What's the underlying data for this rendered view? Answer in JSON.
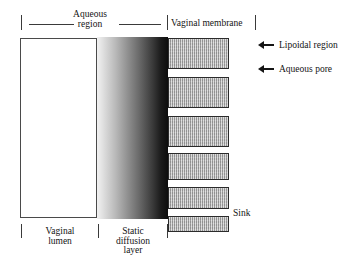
{
  "figure": {
    "type": "schematic-diagram"
  },
  "top_labels": {
    "aqueous_region": "Aqueous\nregion",
    "aqueous_region_line1": "Aqueous",
    "aqueous_region_line2": "region",
    "vaginal_membrane": "Vaginal membrane"
  },
  "right_annotations": [
    {
      "label": "Lipoidal region",
      "icon": "left-arrow-icon",
      "points_to": "membrane-bar"
    },
    {
      "label": "Aqueous pore",
      "icon": "left-arrow-icon",
      "points_to": "membrane-gap"
    }
  ],
  "inline_labels": {
    "sink": "Sink"
  },
  "bottom_labels": {
    "vaginal_lumen_line1": "Vaginal",
    "vaginal_lumen_line2": "lumen",
    "static_diffusion_line1": "Static",
    "static_diffusion_line2": "diffusion",
    "static_diffusion_line3": "layer"
  },
  "regions": {
    "lumen": {
      "name": "Vaginal lumen",
      "fill": "#ffffff",
      "border": "#4a4a4a"
    },
    "static_diffusion_layer": {
      "name": "Static diffusion layer",
      "gradient_from": "#f2f2f2",
      "gradient_to": "#0d0d0d",
      "direction": "left-to-right light-to-dark"
    },
    "membrane": {
      "name": "Vaginal membrane",
      "bar_fill": "#b0b0b0",
      "bar_border": "#2b2b2b",
      "texture": "vertical-pinstripe",
      "bar_count": 6,
      "gap_meaning": "Aqueous pore",
      "bar_meaning": "Lipoidal region"
    }
  },
  "membrane_bars": [
    {
      "index": 1,
      "top": 1,
      "height": 31
    },
    {
      "index": 2,
      "top": 40,
      "height": 31
    },
    {
      "index": 3,
      "top": 79,
      "height": 31
    },
    {
      "index": 4,
      "top": 116,
      "height": 27
    },
    {
      "index": 5,
      "top": 150,
      "height": 22
    },
    {
      "index": 6,
      "top": 179,
      "height": 16
    }
  ],
  "colors": {
    "stroke": "#3a3a3a",
    "text": "#141414",
    "arrow": "#151515"
  }
}
